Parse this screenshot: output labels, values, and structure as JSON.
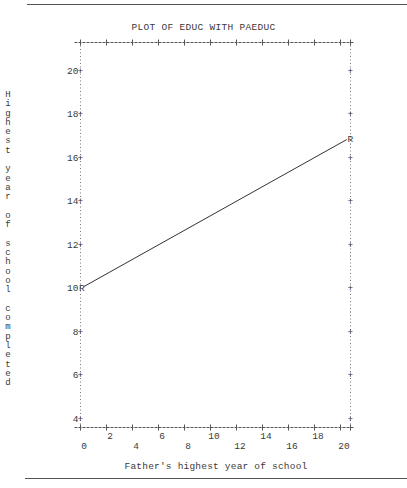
{
  "page": {
    "top_rule": true,
    "bottom_rule": true
  },
  "chart_data": {
    "type": "line",
    "title": "PLOT OF EDUC WITH PAEDUC",
    "xlabel": "Father's highest year of school",
    "ylabel": "Highest year of school completed",
    "xlim": [
      0,
      20.6
    ],
    "ylim": [
      3.6,
      21.6
    ],
    "x_ticks": [
      0,
      2,
      4,
      6,
      8,
      10,
      12,
      14,
      16,
      18,
      20
    ],
    "y_ticks": [
      4,
      6,
      8,
      10,
      12,
      14,
      16,
      18,
      20
    ],
    "grid": false,
    "legend": null,
    "marker_symbol": "R",
    "series": [
      {
        "name": "Regression line",
        "x": [
          0,
          20.6
        ],
        "y": [
          10.0,
          16.85
        ]
      }
    ],
    "annotations": [
      "R at left end (x=0, y=10)",
      "R at right end (x≈20.6, y≈16.85)"
    ]
  }
}
